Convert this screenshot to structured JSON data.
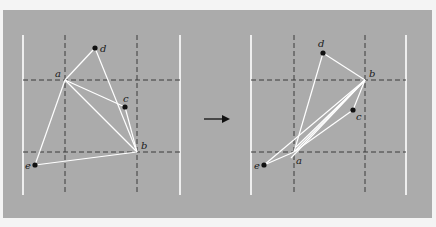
{
  "figure": {
    "background_color": "#ababab",
    "page_color": "#f4f4f4",
    "line_color": "#ffffff",
    "dash_color": "#3a3a3a",
    "point_color": "#111111",
    "arrow": {
      "x1": 204,
      "x2": 230,
      "y": 119
    }
  },
  "panels": [
    {
      "id": "before",
      "bounds": {
        "left": 23,
        "right": 180,
        "top": 35,
        "bottom": 195
      },
      "dashed_v": [
        65,
        137
      ],
      "dashed_h": [
        80,
        152
      ],
      "points": [
        {
          "name": "a",
          "x": 65,
          "y": 80,
          "dot": false,
          "lx": 55,
          "ly": 77
        },
        {
          "name": "b",
          "x": 137,
          "y": 152,
          "dot": false,
          "lx": 141,
          "ly": 149
        },
        {
          "name": "c",
          "x": 125,
          "y": 107,
          "dot": true,
          "lx": 123,
          "ly": 102
        },
        {
          "name": "d",
          "x": 95,
          "y": 48,
          "dot": true,
          "lx": 100,
          "ly": 52
        },
        {
          "name": "e",
          "x": 35,
          "y": 165,
          "dot": true,
          "lx": 25,
          "ly": 169
        }
      ],
      "edges": [
        [
          "a",
          "d"
        ],
        [
          "d",
          "b"
        ],
        [
          "a",
          "c"
        ],
        [
          "c",
          "b"
        ],
        [
          "a",
          "b"
        ],
        [
          "a",
          "e"
        ],
        [
          "e",
          "b"
        ]
      ]
    },
    {
      "id": "after",
      "bounds": {
        "left": 251,
        "right": 406,
        "top": 35,
        "bottom": 195
      },
      "dashed_v": [
        294,
        365
      ],
      "dashed_h": [
        80,
        152
      ],
      "points": [
        {
          "name": "a",
          "x": 294,
          "y": 152,
          "dot": false,
          "lx": 296,
          "ly": 164
        },
        {
          "name": "b",
          "x": 365,
          "y": 80,
          "dot": false,
          "lx": 369,
          "ly": 77
        },
        {
          "name": "c",
          "x": 353,
          "y": 110,
          "dot": true,
          "lx": 356,
          "ly": 120
        },
        {
          "name": "d",
          "x": 323,
          "y": 53,
          "dot": true,
          "lx": 318,
          "ly": 47
        },
        {
          "name": "e",
          "x": 264,
          "y": 165,
          "dot": true,
          "lx": 254,
          "ly": 169
        }
      ],
      "edges": [
        [
          "d",
          "b"
        ],
        [
          "d",
          "a"
        ],
        [
          "b",
          "a"
        ],
        [
          "b",
          "c"
        ],
        [
          "c",
          "a"
        ],
        [
          "e",
          "b"
        ],
        [
          "e",
          "a"
        ]
      ],
      "extra_lines": [
        [
          365,
          80,
          296,
          147
        ],
        [
          365,
          80,
          291,
          158
        ]
      ]
    }
  ]
}
